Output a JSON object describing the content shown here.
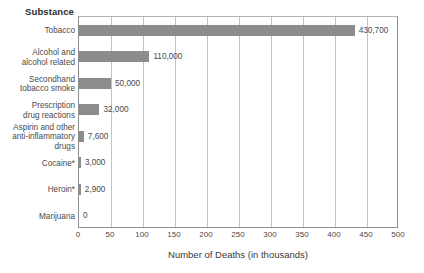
{
  "chart_data": {
    "type": "bar",
    "orientation": "horizontal",
    "title": "",
    "xlabel": "Number of Deaths (in thousands)",
    "ylabel": "Substance",
    "xlim": [
      0,
      500
    ],
    "xticks": [
      0,
      50,
      100,
      150,
      200,
      250,
      300,
      350,
      400,
      450,
      500
    ],
    "xtick_labels": [
      "0",
      "50",
      "100",
      "150",
      "200",
      "250",
      "300",
      "350",
      "400",
      "450",
      "500"
    ],
    "grid": true,
    "legend": "none",
    "bar_color": "#8c8c8c",
    "categories": [
      "Tobacco",
      "Alcohol and\nalcohol related",
      "Secondhand\ntobacco smoke",
      "Prescription\ndrug reactions",
      "Aspirin and other\nanti-inflammatory\ndrugs",
      "Cocaine*",
      "Heroin*",
      "Marijuana"
    ],
    "values": [
      430.7,
      110,
      50,
      32,
      7.6,
      3.0,
      2.9,
      0
    ],
    "value_labels": [
      "430,700",
      "110,000",
      "50,000",
      "32,000",
      "7,600",
      "3,000",
      "2,900",
      "0"
    ]
  },
  "axis_header": "Substance"
}
